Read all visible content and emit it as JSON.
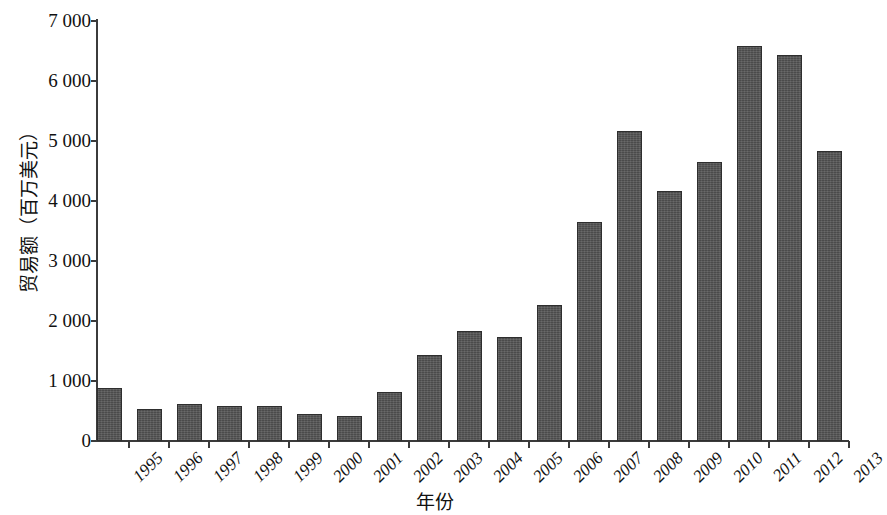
{
  "chart_data": {
    "type": "bar",
    "title": "",
    "xlabel": "年份",
    "ylabel": "贸易额（百万美元）",
    "categories": [
      "1995",
      "1996",
      "1997",
      "1998",
      "1999",
      "2000",
      "2001",
      "2002",
      "2003",
      "2004",
      "2005",
      "2006",
      "2007",
      "2008",
      "2009",
      "2010",
      "2011",
      "2012",
      "2013"
    ],
    "values": [
      880,
      540,
      610,
      590,
      590,
      450,
      420,
      820,
      1440,
      1840,
      1740,
      2270,
      3650,
      5170,
      4160,
      4650,
      6580,
      6440,
      4830
    ],
    "ylim": [
      0,
      7000
    ],
    "ytick_labels": [
      "0",
      "1 000",
      "2 000",
      "3 000",
      "4 000",
      "5 000",
      "6 000",
      "7 000"
    ],
    "ytick_values": [
      0,
      1000,
      2000,
      3000,
      4000,
      5000,
      6000,
      7000
    ],
    "grid": false,
    "legend": null,
    "bar_color": "#4b4b4b",
    "bar_edge_color": "#2e2e2e",
    "axis_color": "#3b3b3b",
    "background": "#ffffff",
    "note": "last bar (2013) is clipped by the right image edge"
  }
}
